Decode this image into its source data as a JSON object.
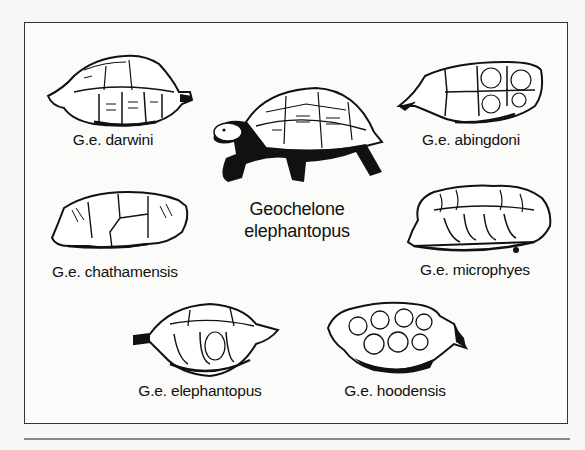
{
  "figure": {
    "main_species": {
      "line1": "Geochelone",
      "line2": "elephantopus",
      "icon": "giant-tortoise-illustration"
    },
    "subspecies": [
      {
        "label": "G.e. darwini",
        "icon": "shell-illustration"
      },
      {
        "label": "G.e. abingdoni",
        "icon": "shell-illustration"
      },
      {
        "label": "G.e. chathamensis",
        "icon": "shell-illustration"
      },
      {
        "label": "G.e. microphyes",
        "icon": "shell-illustration"
      },
      {
        "label": "G.e. elephantopus",
        "icon": "shell-illustration"
      },
      {
        "label": "G.e. hoodensis",
        "icon": "shell-illustration"
      }
    ]
  },
  "colors": {
    "ink": "#111111",
    "paper": "#fbfbfa",
    "frame": "#333333"
  }
}
